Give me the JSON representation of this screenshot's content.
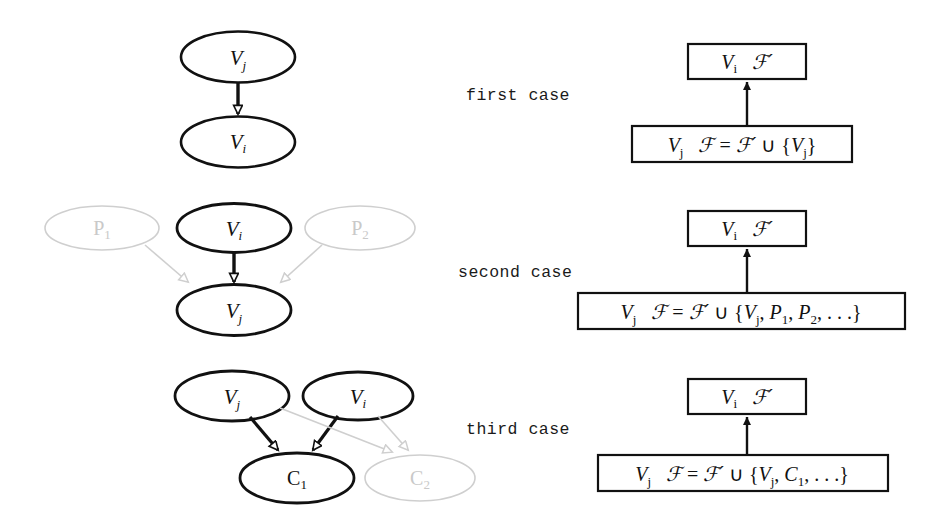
{
  "figure": {
    "background_color": "#ffffff",
    "solid_color": "#111111",
    "ghost_color": "#c9c9c9"
  },
  "cases": [
    {
      "id": "first",
      "label": "first case",
      "graph": {
        "nodes": [
          {
            "id": "vj",
            "base": "V",
            "sub": "j",
            "style": "solid",
            "italic": true
          },
          {
            "id": "vi",
            "base": "V",
            "sub": "i",
            "style": "solid",
            "italic": true
          }
        ],
        "edges": [
          {
            "from": "vj",
            "to": "vi",
            "style": "solid"
          }
        ]
      },
      "boxes": {
        "top": {
          "left": "V",
          "left_sub": "i",
          "right": "F",
          "right_prime": "′"
        },
        "bottom_text": "V_j   F = F' ∪ {V_j}",
        "bottom_parts": {
          "var": "V",
          "var_sub": "j",
          "eq_lhs": "ℱ",
          "eq": "=",
          "eq_rhs": "ℱ′",
          "union": "∪",
          "set": "{Vⱼ}"
        }
      }
    },
    {
      "id": "second",
      "label": "second case",
      "graph": {
        "nodes": [
          {
            "id": "p1",
            "base": "P",
            "sub": "1",
            "style": "ghost",
            "italic": false
          },
          {
            "id": "vi",
            "base": "V",
            "sub": "i",
            "style": "solid",
            "italic": true
          },
          {
            "id": "p2",
            "base": "P",
            "sub": "2",
            "style": "ghost",
            "italic": false
          },
          {
            "id": "vj",
            "base": "V",
            "sub": "j",
            "style": "solid",
            "italic": true
          }
        ],
        "edges": [
          {
            "from": "p1",
            "to": "vj",
            "style": "ghost"
          },
          {
            "from": "vi",
            "to": "vj",
            "style": "solid"
          },
          {
            "from": "p2",
            "to": "vj",
            "style": "ghost"
          }
        ]
      },
      "boxes": {
        "top": {
          "left": "V",
          "left_sub": "i",
          "right": "F",
          "right_prime": "′"
        },
        "bottom_text": "V_j   F = F' ∪ {V_j, P_1, P_2, ...}",
        "bottom_parts": {
          "var": "V",
          "var_sub": "j",
          "set": "{Vⱼ, P₁, P₂, …}"
        }
      }
    },
    {
      "id": "third",
      "label": "third case",
      "graph": {
        "nodes": [
          {
            "id": "vj",
            "base": "V",
            "sub": "j",
            "style": "solid",
            "italic": true
          },
          {
            "id": "vi",
            "base": "V",
            "sub": "i",
            "style": "solid",
            "italic": true
          },
          {
            "id": "c1",
            "base": "C",
            "sub": "1",
            "style": "solid",
            "italic": false
          },
          {
            "id": "c2",
            "base": "C",
            "sub": "2",
            "style": "ghost",
            "italic": false
          }
        ],
        "edges": [
          {
            "from": "vj",
            "to": "c1",
            "style": "solid"
          },
          {
            "from": "vi",
            "to": "c1",
            "style": "solid"
          },
          {
            "from": "vj",
            "to": "c2",
            "style": "ghost"
          },
          {
            "from": "vi",
            "to": "c2",
            "style": "ghost"
          }
        ]
      },
      "boxes": {
        "top": {
          "left": "V",
          "left_sub": "i",
          "right": "F",
          "right_prime": "′"
        },
        "bottom_text": "V_j   F = F' ∪ {V_j, C_1, ...}",
        "bottom_parts": {
          "var": "V",
          "var_sub": "j",
          "set": "{Vⱼ, C₁, …}"
        }
      }
    }
  ],
  "glyphs": {
    "script_f": "ℱ",
    "prime": "′",
    "union": "∪",
    "equals": "=",
    "lbrace": "{",
    "rbrace": "}",
    "comma": ",",
    "ellipsis": "…"
  },
  "labels": {
    "first_case": "first case",
    "second_case": "second case",
    "third_case": "third case"
  }
}
